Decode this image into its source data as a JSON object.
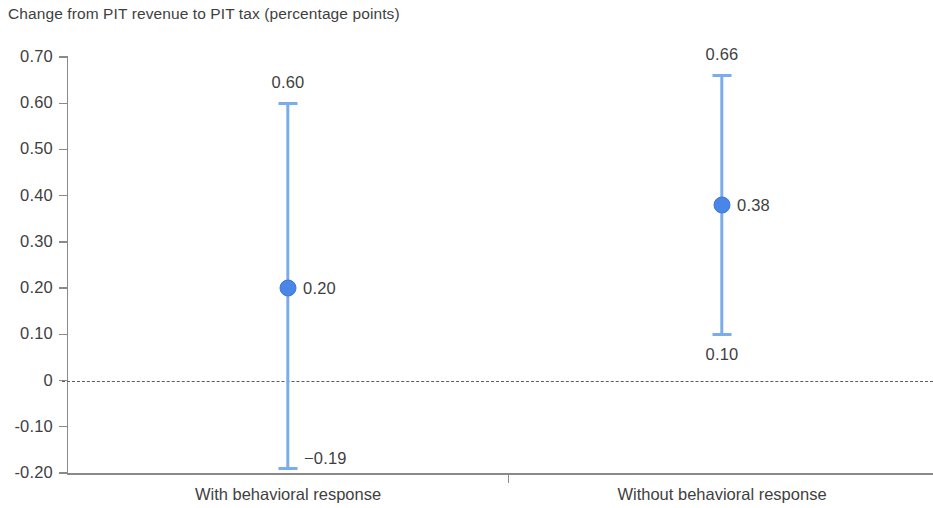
{
  "chart_data": {
    "type": "scatter",
    "title": "Change from PIT revenue to PIT tax (percentage points)",
    "xlabel": "",
    "ylabel": "",
    "ylim": [
      -0.2,
      0.7
    ],
    "grid": false,
    "legend": null,
    "categories": [
      "With behavioral response",
      "Without behavioral response"
    ],
    "y_ticks": [
      {
        "value": 0.7,
        "label": "0.70"
      },
      {
        "value": 0.6,
        "label": "0.60"
      },
      {
        "value": 0.5,
        "label": "0.50"
      },
      {
        "value": 0.4,
        "label": "0.40"
      },
      {
        "value": 0.3,
        "label": "0.30"
      },
      {
        "value": 0.2,
        "label": "0.20"
      },
      {
        "value": 0.1,
        "label": "0.10"
      },
      {
        "value": 0.0,
        "label": "0"
      },
      {
        "value": -0.1,
        "label": "-0.10"
      },
      {
        "value": -0.2,
        "label": "-0.20"
      }
    ],
    "reference_line": {
      "value": 0,
      "style": "dashed"
    },
    "points": [
      {
        "category": "With behavioral response",
        "estimate": 0.2,
        "estimate_label": "0.20",
        "upper": 0.6,
        "upper_label": "0.60",
        "lower": -0.19,
        "lower_label": "−0.19"
      },
      {
        "category": "Without behavioral response",
        "estimate": 0.38,
        "estimate_label": "0.38",
        "upper": 0.66,
        "upper_label": "0.66",
        "lower": 0.1,
        "lower_label": "0.10"
      }
    ],
    "colors": {
      "marker": "#4a86e8",
      "marker_border": "#3c78d8",
      "whisker": "#7cadeb",
      "axis": "#8a8a8a",
      "text": "#3f3f3f",
      "reference_line": "#5d5d5d",
      "background": "#ffffff"
    }
  }
}
